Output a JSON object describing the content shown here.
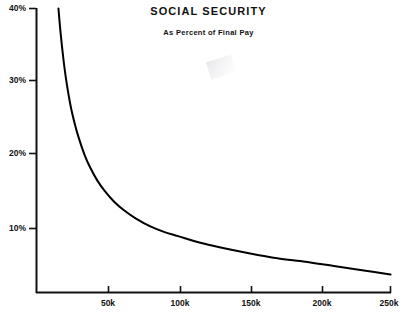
{
  "chart_data": {
    "type": "line",
    "title": "SOCIAL  SECURITY",
    "subtitle": "As Percent of Final Pay",
    "xlabel": "",
    "ylabel": "",
    "grid": false,
    "legend": "none",
    "xlim": [
      15000,
      250000
    ],
    "ylim": [
      0,
      40
    ],
    "xticks": [
      50000,
      100000,
      150000,
      200000,
      250000
    ],
    "xtick_labels": [
      "50k",
      "100k",
      "150k",
      "200k",
      "250k"
    ],
    "yticks": [
      10,
      20,
      30,
      40
    ],
    "ytick_labels": [
      "10%",
      "20%",
      "30%",
      "40%"
    ],
    "line_color": "#000000",
    "series": [
      {
        "name": "Social Security as percent of final pay",
        "x": [
          15500,
          17000,
          19000,
          21000,
          24000,
          27000,
          30000,
          34000,
          38000,
          43000,
          48000,
          55000,
          62000,
          70000,
          80000,
          90000,
          100000,
          115000,
          130000,
          150000,
          170000,
          190000,
          210000,
          230000,
          250000
        ],
        "values": [
          40.0,
          36.6,
          32.9,
          29.9,
          26.4,
          23.8,
          21.7,
          19.4,
          17.6,
          15.8,
          14.4,
          12.8,
          11.6,
          10.5,
          9.4,
          8.6,
          8.0,
          7.1,
          6.4,
          5.6,
          4.9,
          4.4,
          3.8,
          3.2,
          2.6
        ]
      }
    ]
  },
  "axes": {
    "x_axis_name": "income-axis",
    "y_axis_name": "percent-axis"
  }
}
